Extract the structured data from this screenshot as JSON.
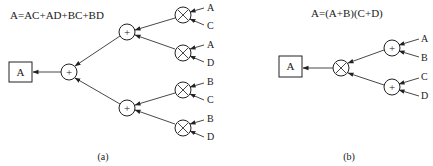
{
  "diagram_a": {
    "equation": "A=AC+AD+BC+BD",
    "output_label": "A",
    "root_op": "+",
    "mid_ops": [
      "+",
      "+"
    ],
    "leaf_ops": [
      "×",
      "×",
      "×",
      "×"
    ],
    "inputs": [
      "A",
      "C",
      "A",
      "D",
      "B",
      "C",
      "B",
      "D"
    ],
    "caption": "(a)"
  },
  "diagram_b": {
    "equation": "A=(A+B)(C+D)",
    "output_label": "A",
    "root_op": "×",
    "leaf_ops": [
      "+",
      "+"
    ],
    "inputs": [
      "A",
      "B",
      "C",
      "D"
    ],
    "caption": "(b)"
  },
  "colors": {
    "ink": "#222222",
    "background": "#ffffff"
  }
}
